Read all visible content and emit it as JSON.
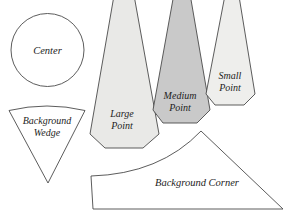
{
  "document": {
    "title": "Pattern Template Shapes",
    "background_color": "#ffffff",
    "width": 283,
    "height": 211
  },
  "style": {
    "outline_color": "#4a4a4a",
    "label_color": "#1d1d1d",
    "fill_white": "#ffffff",
    "fill_light_gray": "#e9e9e7",
    "fill_medium_gray": "#c9c9c9",
    "fill_pale_gray": "#eeeeec"
  },
  "shapes": [
    {
      "id": "center",
      "label": "Center",
      "kind": "circle",
      "fill": "#ffffff",
      "label_lines": [
        "Center"
      ],
      "label_x": 47.5,
      "label_y": 54,
      "font_size": 10.5,
      "geometry": {
        "cx": 47.5,
        "cy": 50,
        "r": 36.5
      }
    },
    {
      "id": "background-wedge",
      "label": "Background Wedge",
      "kind": "wedge",
      "fill": "#ffffff",
      "label_lines": [
        "Background",
        "Wedge"
      ],
      "label_x": 47,
      "label_y": 124,
      "font_size": 10,
      "geometry": {
        "path": "M 9,110.5 Q 47,101.5 85,110.5 L 48,183 Z"
      }
    },
    {
      "id": "large-point",
      "label": "Large Point",
      "kind": "point",
      "fill": "#e9e9e7",
      "label_lines": [
        "Large",
        "Point"
      ],
      "label_x": 122,
      "label_y": 117,
      "font_size": 10,
      "geometry": {
        "path": "M 116,-16 L 132,-16 L 159,134 L 143,148 L 105,148 L 90,134 Z"
      }
    },
    {
      "id": "medium-point",
      "label": "Medium Point",
      "kind": "point",
      "fill": "#c9c9c9",
      "label_lines": [
        "Medium",
        "Point"
      ],
      "label_x": 180,
      "label_y": 99,
      "font_size": 10,
      "geometry": {
        "path": "M 175,-12 L 189,-12 L 210,110 L 197,123 L 163,123 L 153,110 Z"
      }
    },
    {
      "id": "small-point",
      "label": "Small Point",
      "kind": "point",
      "fill": "#eeeeec",
      "label_lines": [
        "Small",
        "Point"
      ],
      "label_x": 230,
      "label_y": 79,
      "font_size": 10,
      "geometry": {
        "path": "M 226,-10 L 238,-10 L 255,94 L 244,105 L 215,105 L 206,94 Z"
      }
    },
    {
      "id": "background-corner",
      "label": "Background Corner",
      "kind": "corner",
      "fill": "#ffffff",
      "label_lines": [
        "Background Corner"
      ],
      "label_x": 197,
      "label_y": 186,
      "font_size": 10.5,
      "geometry": {
        "path": "M 91,176 Q 160,174 201,131 L 283,209 L 93,209 Z"
      }
    }
  ]
}
